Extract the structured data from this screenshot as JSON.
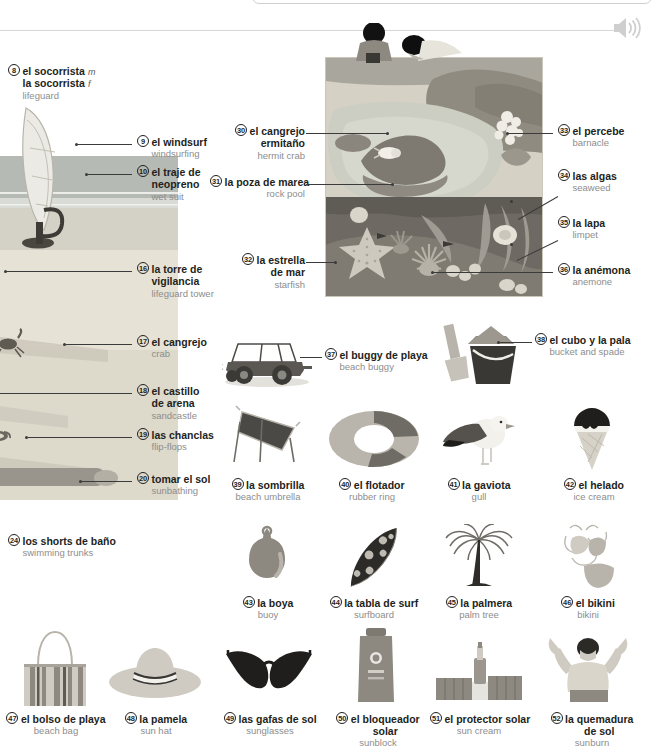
{
  "page": {
    "audio_icon": "speaker-icon",
    "top_searchbox_value": ""
  },
  "colors": {
    "spanish_text": "#231f20",
    "english_text": "#8d8d8d",
    "leader_line": "#3b3b3b",
    "rule": "#d7d7d7",
    "sand": "#ded7c8",
    "sea": "#b9bdb8",
    "rock_dark": "#8a8a84",
    "water_pale": "#cfd3cc",
    "underwater": "#6f6f6f"
  },
  "entries": [
    {
      "num": "8",
      "es": "el socorrista",
      "gen1": "m",
      "es2": "la socorrista",
      "gen2": "f",
      "en": "lifeguard"
    },
    {
      "num": "9",
      "es": "el windsurf",
      "en": "windsurfing"
    },
    {
      "num": "10",
      "es": "el traje de neopreno",
      "en": "wet suit"
    },
    {
      "num": "16",
      "es": "la torre de vigilancia",
      "en": "lifeguard tower"
    },
    {
      "num": "17",
      "es": "el cangrejo",
      "en": "crab"
    },
    {
      "num": "18",
      "es": "el castillo de arena",
      "en": "sandcastle"
    },
    {
      "num": "19",
      "es": "las chanclas",
      "en": "flip-flops"
    },
    {
      "num": "20",
      "es": "tomar el sol",
      "en": "sunbathing"
    },
    {
      "num": "24",
      "es": "los shorts de baño",
      "en": "swimming trunks"
    },
    {
      "num": "30",
      "es": "el cangrejo ermitaño",
      "en": "hermit crab"
    },
    {
      "num": "31",
      "es": "la poza de marea",
      "en": "rock pool"
    },
    {
      "num": "32",
      "es": "la estrella de mar",
      "en": "starfish"
    },
    {
      "num": "33",
      "es": "el percebe",
      "en": "barnacle"
    },
    {
      "num": "34",
      "es": "las algas",
      "en": "seaweed"
    },
    {
      "num": "35",
      "es": "la lapa",
      "en": "limpet"
    },
    {
      "num": "36",
      "es": "la anémona",
      "en": "anemone"
    },
    {
      "num": "37",
      "es": "el buggy de playa",
      "en": "beach buggy"
    },
    {
      "num": "38",
      "es": "el cubo y la pala",
      "en": "bucket and spade"
    },
    {
      "num": "39",
      "es": "la sombrilla",
      "en": "beach umbrella"
    },
    {
      "num": "40",
      "es": "el flotador",
      "en": "rubber ring"
    },
    {
      "num": "41",
      "es": "la gaviota",
      "en": "gull"
    },
    {
      "num": "42",
      "es": "el helado",
      "en": "ice cream"
    },
    {
      "num": "43",
      "es": "la boya",
      "en": "buoy"
    },
    {
      "num": "44",
      "es": "la tabla de surf",
      "en": "surfboard"
    },
    {
      "num": "45",
      "es": "la palmera",
      "en": "palm tree"
    },
    {
      "num": "46",
      "es": "el bikini",
      "en": "bikini"
    },
    {
      "num": "47",
      "es": "el bolso de playa",
      "en": "beach bag"
    },
    {
      "num": "48",
      "es": "la pamela",
      "en": "sun hat"
    },
    {
      "num": "49",
      "es": "las gafas de sol",
      "en": "sunglasses"
    },
    {
      "num": "50",
      "es": "el bloqueador solar",
      "en": "sunblock"
    },
    {
      "num": "51",
      "es": "el protector solar",
      "en": "sun cream"
    },
    {
      "num": "52",
      "es": "la quemadura de sol",
      "en": "sunburn"
    }
  ],
  "labels": {
    "l8": {
      "num": "8",
      "es": "el socorrista",
      "gen": "m",
      "es2": "la socorrista",
      "gen2": "f",
      "en": "lifeguard"
    },
    "l9": {
      "num": "9",
      "es": "el windsurf",
      "en": "windsurfing"
    },
    "l10": {
      "num": "10",
      "es": "el traje de",
      "es2": "neopreno",
      "en": "wet suit"
    },
    "l16": {
      "num": "16",
      "es": "la torre de",
      "es2": "vigilancia",
      "en": "lifeguard tower"
    },
    "l17": {
      "num": "17",
      "es": "el cangrejo",
      "en": "crab"
    },
    "l18": {
      "num": "18",
      "es": "el castillo",
      "es2": "de arena",
      "en": "sandcastle"
    },
    "l19": {
      "num": "19",
      "es": "las chanclas",
      "en": "flip-flops"
    },
    "l20": {
      "num": "20",
      "es": "tomar el sol",
      "en": "sunbathing"
    },
    "l24": {
      "num": "24",
      "es": "los shorts de baño",
      "en": "swimming trunks"
    },
    "l30": {
      "num": "30",
      "es": "el cangrejo",
      "es2": "ermitaño",
      "en": "hermit crab"
    },
    "l31": {
      "num": "31",
      "es": "la poza de marea",
      "en": "rock pool"
    },
    "l32": {
      "num": "32",
      "es": "la estrella",
      "es2": "de mar",
      "en": "starfish"
    },
    "l33": {
      "num": "33",
      "es": "el percebe",
      "en": "barnacle"
    },
    "l34": {
      "num": "34",
      "es": "las algas",
      "en": "seaweed"
    },
    "l35": {
      "num": "35",
      "es": "la lapa",
      "en": "limpet"
    },
    "l36": {
      "num": "36",
      "es": "la anémona",
      "en": "anemone"
    },
    "l37": {
      "num": "37",
      "es": "el buggy de playa",
      "en": "beach buggy"
    },
    "l38": {
      "num": "38",
      "es": "el cubo y la pala",
      "en": "bucket and spade"
    },
    "l39": {
      "num": "39",
      "es": "la sombrilla",
      "en": "beach umbrella"
    },
    "l40": {
      "num": "40",
      "es": "el flotador",
      "en": "rubber ring"
    },
    "l41": {
      "num": "41",
      "es": "la gaviota",
      "en": "gull"
    },
    "l42": {
      "num": "42",
      "es": "el helado",
      "en": "ice cream"
    },
    "l43": {
      "num": "43",
      "es": "la boya",
      "en": "buoy"
    },
    "l44": {
      "num": "44",
      "es": "la tabla de surf",
      "en": "surfboard"
    },
    "l45": {
      "num": "45",
      "es": "la palmera",
      "en": "palm tree"
    },
    "l46": {
      "num": "46",
      "es": "el bikini",
      "en": "bikini"
    },
    "l47": {
      "num": "47",
      "es": "el bolso de playa",
      "en": "beach bag"
    },
    "l48": {
      "num": "48",
      "es": "la pamela",
      "en": "sun hat"
    },
    "l49": {
      "num": "49",
      "es": "las gafas de sol",
      "en": "sunglasses"
    },
    "l50": {
      "num": "50",
      "es": "el bloqueador",
      "es2": "solar",
      "en": "sunblock"
    },
    "l51": {
      "num": "51",
      "es": "el protector solar",
      "en": "sun cream"
    },
    "l52": {
      "num": "52",
      "es": "la quemadura",
      "es2": "de sol",
      "en": "sunburn"
    }
  }
}
